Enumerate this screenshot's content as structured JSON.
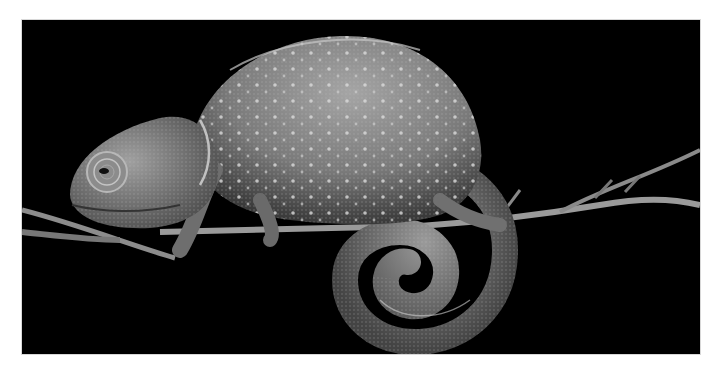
{
  "image": {
    "subject": "chameleon on branch",
    "alt": "Black-and-white photograph of a chameleon perched on a thin branch with its tail curled into a spiral, against a black background",
    "colors": {
      "background": "#000000",
      "frame": "#ffffff",
      "body": "#8a8a8a",
      "highlight": "#d6d6d6",
      "branch": "#9a9a9a"
    }
  }
}
